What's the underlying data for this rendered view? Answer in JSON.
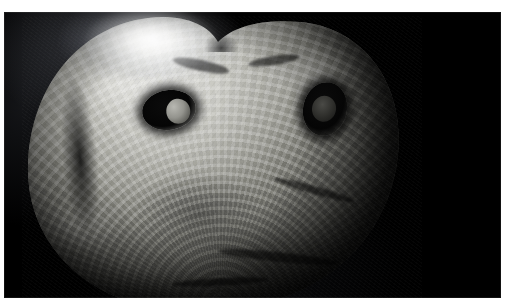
{
  "page": {
    "background_color": "#ffffff",
    "width": 505,
    "height": 306
  },
  "caption": {
    "text": "",
    "note_visible": "bottom pixel row of a clipped line of text",
    "color": "#9aa0b4"
  },
  "photo": {
    "alt_name": "specimen-photograph",
    "medium": "black-and-white photograph",
    "subject": "heart-shaped fossil shell specimen with two perforations",
    "background_color": "#000000",
    "frame": {
      "left": 4,
      "top": 12,
      "width": 497,
      "height": 286
    },
    "lighting": {
      "key_light_position": "top-left",
      "highlight_color": "#ffffff",
      "shadow_color": "#000000"
    },
    "features": [
      {
        "name": "rim-highlight",
        "label": "bright blown-out highlight along upper-left rim"
      },
      {
        "name": "top-notch",
        "label": "V-shaped notch at top centre of the shell"
      },
      {
        "name": "perforation-left",
        "label": "left perforation with pale rounded plug"
      },
      {
        "name": "perforation-right",
        "label": "right perforation, dark oval cavity"
      },
      {
        "name": "growth-rings",
        "label": "concentric growth-ring texture across the surface"
      },
      {
        "name": "radial-ribs",
        "label": "radial rib striations fanning from the lower umbo"
      }
    ],
    "palette": {
      "black": "#000000",
      "deep_shadow": "#0b0b0b",
      "mid_grey": "#7e7e78",
      "light_grey": "#cfcfca",
      "highlight_white": "#e9e9e6"
    }
  }
}
